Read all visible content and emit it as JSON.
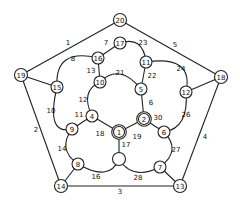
{
  "diagram": {
    "type": "graph",
    "colors": {
      "stroke": "#222222",
      "background": "#ffffff",
      "text": "#111111"
    },
    "nodes": [
      {
        "id": "20",
        "label": "20",
        "x": 120,
        "y": 20,
        "r": 6.5,
        "double": false
      },
      {
        "id": "19",
        "label": "19",
        "x": 21,
        "y": 75,
        "r": 6.5,
        "double": false
      },
      {
        "id": "18",
        "label": "18",
        "x": 221,
        "y": 77,
        "r": 6.5,
        "double": false
      },
      {
        "id": "14",
        "label": "14",
        "x": 61,
        "y": 186,
        "r": 6.5,
        "double": false
      },
      {
        "id": "13",
        "label": "13",
        "x": 180,
        "y": 186,
        "r": 6.5,
        "double": false
      },
      {
        "id": "17",
        "label": "17",
        "x": 120,
        "y": 43,
        "r": 6,
        "double": false
      },
      {
        "id": "16",
        "label": "16",
        "x": 98,
        "y": 58,
        "r": 6,
        "double": false
      },
      {
        "id": "11",
        "label": "11",
        "x": 146,
        "y": 62,
        "r": 6,
        "double": false
      },
      {
        "id": "15",
        "label": "15",
        "x": 57,
        "y": 87,
        "r": 6,
        "double": false
      },
      {
        "id": "12",
        "label": "12",
        "x": 186,
        "y": 92,
        "r": 6,
        "double": false
      },
      {
        "id": "10",
        "label": "10",
        "x": 100,
        "y": 82,
        "r": 6,
        "double": false
      },
      {
        "id": "5",
        "label": "5",
        "x": 141,
        "y": 89,
        "r": 6,
        "double": false
      },
      {
        "id": "4",
        "label": "4",
        "x": 92,
        "y": 116,
        "r": 6,
        "double": false
      },
      {
        "id": "9",
        "label": "9",
        "x": 72,
        "y": 129,
        "r": 6,
        "double": false
      },
      {
        "id": "1",
        "label": "1",
        "x": 119,
        "y": 132,
        "r": 5.5,
        "double": true
      },
      {
        "id": "2",
        "label": "2",
        "x": 144,
        "y": 119,
        "r": 5.5,
        "double": true
      },
      {
        "id": "6",
        "label": "6",
        "x": 164,
        "y": 132,
        "r": 6,
        "double": false
      },
      {
        "id": "8",
        "label": "8",
        "x": 78,
        "y": 164,
        "r": 6,
        "double": false
      },
      {
        "id": "c",
        "label": "",
        "x": 119,
        "y": 159,
        "r": 6.5,
        "double": false
      },
      {
        "id": "7",
        "label": "7",
        "x": 160,
        "y": 167,
        "r": 6,
        "double": false
      }
    ],
    "edges": [
      {
        "label": "1",
        "from": "20",
        "to": "19",
        "lx": 68,
        "ly": 43,
        "curve": null
      },
      {
        "label": "5",
        "from": "20",
        "to": "18",
        "lx": 175,
        "ly": 45,
        "curve": null
      },
      {
        "label": "2",
        "from": "19",
        "to": "14",
        "lx": 36,
        "ly": 130,
        "curve": null
      },
      {
        "label": "4",
        "from": "18",
        "to": "13",
        "lx": 205,
        "ly": 137,
        "curve": null
      },
      {
        "label": "3",
        "from": "14",
        "to": "13",
        "lx": 120,
        "ly": 192,
        "curve": null
      },
      {
        "label": "7",
        "from": "17",
        "to": "16",
        "lx": 106,
        "ly": 43,
        "curve": null
      },
      {
        "label": "23",
        "from": "17",
        "to": "11",
        "lx": 143,
        "ly": 43,
        "curve": [
          138,
          44
        ]
      },
      {
        "label": "8",
        "from": "16",
        "to": "15",
        "lx": 73,
        "ly": 59,
        "curve": [
          66,
          60
        ]
      },
      {
        "label": "24",
        "from": "11",
        "to": "12",
        "lx": 181,
        "ly": 69,
        "curve": [
          180,
          66
        ]
      },
      {
        "label": "13",
        "from": "16",
        "to": "10",
        "lx": 91,
        "ly": 71,
        "curve": null
      },
      {
        "label": "22",
        "from": "11",
        "to": "5",
        "lx": 152,
        "ly": 76,
        "curve": null
      },
      {
        "label": "21",
        "from": "10",
        "to": "5",
        "lx": 120,
        "ly": 73,
        "curve": [
          120,
          74
        ]
      },
      {
        "label": "10",
        "from": "15",
        "to": "9",
        "lx": 51,
        "ly": 111,
        "curve": [
          55,
          122
        ]
      },
      {
        "label": "12",
        "from": "10",
        "to": "4",
        "lx": 83,
        "ly": 100,
        "curve": [
          88,
          95
        ]
      },
      {
        "label": "6",
        "from": "5",
        "to": "2",
        "lx": 151,
        "ly": 103,
        "curve": null
      },
      {
        "label": "26",
        "from": "12",
        "to": "6",
        "lx": 186,
        "ly": 115,
        "curve": [
          182,
          120
        ]
      },
      {
        "label": "30",
        "from": "2",
        "to": "6",
        "lx": 158,
        "ly": 118,
        "curve": null
      },
      {
        "label": "11",
        "from": "9",
        "to": "4",
        "lx": 79,
        "ly": 115,
        "curve": null
      },
      {
        "label": "18",
        "from": "4",
        "to": "1",
        "lx": 100,
        "ly": 134,
        "curve": null
      },
      {
        "label": "19",
        "from": "1",
        "to": "2",
        "lx": 137,
        "ly": 137,
        "curve": null
      },
      {
        "label": "17",
        "from": "1",
        "to": "c",
        "lx": 126,
        "ly": 145,
        "curve": null
      },
      {
        "label": "14",
        "from": "9",
        "to": "8",
        "lx": 62,
        "ly": 149,
        "curve": [
          66,
          148
        ]
      },
      {
        "label": "27",
        "from": "6",
        "to": "7",
        "lx": 176,
        "ly": 150,
        "curve": [
          172,
          150
        ]
      },
      {
        "label": "16",
        "from": "8",
        "to": "c",
        "lx": 96,
        "ly": 177,
        "curve": [
          104,
          172
        ]
      },
      {
        "label": "28",
        "from": "c",
        "to": "7",
        "lx": 138,
        "ly": 178,
        "curve": [
          136,
          172
        ]
      },
      {
        "label": "",
        "from": "14",
        "to": "8",
        "lx": null,
        "ly": null,
        "curve": null
      },
      {
        "label": "",
        "from": "13",
        "to": "7",
        "lx": null,
        "ly": null,
        "curve": null
      },
      {
        "label": "",
        "from": "19",
        "to": "15",
        "lx": null,
        "ly": null,
        "curve": null
      },
      {
        "label": "",
        "from": "18",
        "to": "12",
        "lx": null,
        "ly": null,
        "curve": null
      }
    ]
  }
}
